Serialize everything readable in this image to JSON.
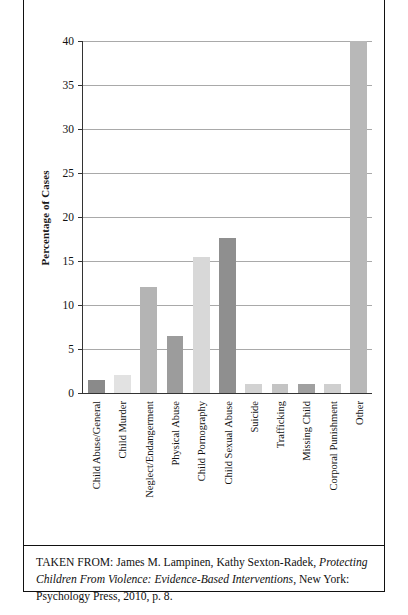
{
  "chart_data": {
    "type": "bar",
    "title": "",
    "xlabel": "",
    "ylabel": "Percentage of Cases",
    "ylim": [
      0,
      40
    ],
    "ytick_step": 5,
    "yticks": [
      "40",
      "35",
      "30",
      "25",
      "20",
      "15",
      "10",
      "5",
      "0"
    ],
    "grid": true,
    "legend": "none",
    "categories": [
      "Child Abuse/General",
      "Child Murder",
      "Neglect/Endangerment",
      "Physical Abuse",
      "Child Pornography",
      "Child Sexual Abuse",
      "Suicide",
      "Trafficking",
      "Missing Child",
      "Corporal Punishment",
      "Other"
    ],
    "values": [
      1.5,
      2.0,
      12.0,
      6.5,
      15.4,
      17.6,
      1.0,
      1.0,
      1.0,
      1.0,
      40.0
    ],
    "bar_colors": [
      "#8a8a8a",
      "#e2e2e2",
      "#b4b4b4",
      "#9c9c9c",
      "#d8d8d8",
      "#8f8f8f",
      "#d2d2d2",
      "#c4c4c4",
      "#a0a0a0",
      "#cfcfcf",
      "#b8b8b8"
    ]
  },
  "axis": {
    "y_title": "Percentage of Cases",
    "axis_color": "#333333",
    "grid_color": "#a9a9a9"
  },
  "caption": {
    "lead": "TAKEN FROM:",
    "authors": "James M. Lampinen, Kathy Sexton-Radek,",
    "book_title": "Protecting Children From Violence: Evidence-Based Interventions",
    "publication": ", New York: Psychology Press, 2010, p. 8."
  }
}
